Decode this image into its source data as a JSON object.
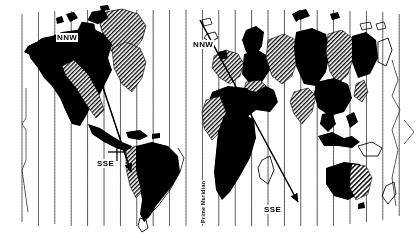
{
  "figure": {
    "kind": "world-map-diagram",
    "projection": "cylindrical",
    "background_color": "#ffffff",
    "ink_color": "#000000",
    "meridian_color": "#3a3a3a"
  },
  "labels": {
    "nnw_west": "NNW",
    "nnw_east": "NNW",
    "sse_west": "SSE",
    "sse_east": "SSE",
    "prime_meridian": "Prime Meridian"
  },
  "grid": {
    "meridian_count": 24,
    "first_x": 22,
    "spacing": 16.4,
    "top_y": 10,
    "bottom_y": 226
  },
  "arrows": [
    {
      "name": "nnw-sse-americas",
      "from_label": "NNW",
      "to_label": "SSE",
      "x1": 90,
      "y1": 48,
      "x2": 131,
      "y2": 172,
      "ticks": [
        {
          "x": 73,
          "y": 100
        },
        {
          "x": 117,
          "y": 152
        }
      ]
    },
    {
      "name": "nnw-sse-afroeurasia",
      "from_label": "NNW",
      "to_label": "SSE",
      "x1": 202,
      "y1": 22,
      "x2": 296,
      "y2": 200,
      "ticks": []
    }
  ],
  "fills": {
    "solid_label": "solid-black",
    "hatch_label": "diagonal-hatch",
    "open_label": "outline-only"
  }
}
